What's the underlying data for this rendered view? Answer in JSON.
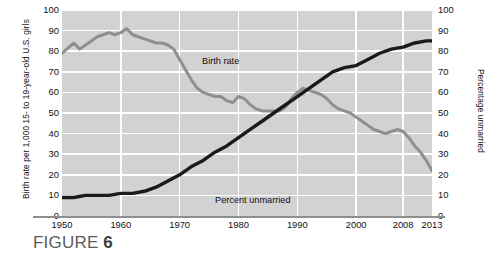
{
  "figure": {
    "caption_prefix": "FIGURE ",
    "caption_number": "6",
    "caption_sub": ""
  },
  "chart_data": {
    "type": "line",
    "title": "",
    "xlabel": "",
    "ylabel": "Birth rate per 1,000 15- to 19-year-old U.S. girls",
    "ylabel_right": "Percentage unmarried",
    "xlim": [
      1950,
      2013
    ],
    "ylim": [
      0,
      100
    ],
    "ylim_right": [
      0,
      100
    ],
    "grid": true,
    "legend_position": "inline-annotations",
    "xticks": [
      1950,
      1960,
      1970,
      1980,
      1990,
      2000,
      2008,
      2013
    ],
    "xticklabels": [
      "1950",
      "1960",
      "1970",
      "1980",
      "1990",
      "2000",
      "2008",
      "2013"
    ],
    "yticks": [
      0,
      10,
      20,
      30,
      40,
      50,
      60,
      70,
      80,
      90,
      100
    ],
    "yticklabels": [
      "0",
      "10",
      "20",
      "30",
      "40",
      "50",
      "60",
      "70",
      "80",
      "90",
      "100"
    ],
    "yticks_right": [
      0,
      10,
      20,
      30,
      40,
      50,
      60,
      70,
      80,
      90,
      100
    ],
    "yticklabels_right": [
      "0",
      "10",
      "20",
      "30",
      "40",
      "50",
      "60",
      "70",
      "80",
      "90",
      "100"
    ],
    "series": [
      {
        "name": "Birth rate",
        "label": "Birth rate",
        "color": "#8f8f8f",
        "axis": "left",
        "x": [
          1950,
          1952,
          1953,
          1954,
          1955,
          1956,
          1957,
          1958,
          1959,
          1960,
          1961,
          1962,
          1963,
          1964,
          1965,
          1966,
          1967,
          1968,
          1969,
          1970,
          1971,
          1972,
          1973,
          1974,
          1975,
          1976,
          1977,
          1978,
          1979,
          1980,
          1981,
          1982,
          1983,
          1984,
          1985,
          1986,
          1987,
          1988,
          1989,
          1990,
          1991,
          1992,
          1993,
          1994,
          1995,
          1996,
          1997,
          1998,
          1999,
          2000,
          2001,
          2002,
          2003,
          2004,
          2005,
          2006,
          2007,
          2008,
          2009,
          2010,
          2011,
          2012,
          2013
        ],
        "y": [
          79,
          84,
          81,
          83,
          85,
          87,
          88,
          89,
          88,
          89,
          91,
          88,
          87,
          86,
          85,
          84,
          84,
          83,
          81,
          76,
          71,
          66,
          62,
          60,
          59,
          58,
          58,
          56,
          55,
          58,
          57,
          54,
          52,
          51,
          51,
          51,
          51,
          53,
          57,
          60,
          62,
          61,
          60,
          59,
          57,
          54,
          52,
          51,
          50,
          48,
          46,
          44,
          42,
          41,
          40,
          41,
          42,
          41,
          38,
          34,
          31,
          27,
          22
        ]
      },
      {
        "name": "Percent unmarried",
        "label": "Percent unmarried",
        "color": "#1a1a1a",
        "axis": "right",
        "x": [
          1950,
          1952,
          1954,
          1956,
          1958,
          1960,
          1962,
          1964,
          1966,
          1968,
          1970,
          1972,
          1974,
          1976,
          1978,
          1980,
          1982,
          1984,
          1986,
          1988,
          1990,
          1992,
          1994,
          1996,
          1998,
          2000,
          2002,
          2004,
          2006,
          2008,
          2010,
          2012,
          2013
        ],
        "y": [
          9,
          9,
          10,
          10,
          10,
          11,
          11,
          12,
          14,
          17,
          20,
          24,
          27,
          31,
          34,
          38,
          42,
          46,
          50,
          54,
          58,
          62,
          66,
          70,
          72,
          73,
          76,
          79,
          81,
          82,
          84,
          85,
          85
        ]
      }
    ]
  }
}
